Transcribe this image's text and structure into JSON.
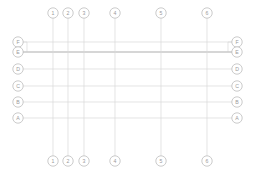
{
  "drawing": {
    "title": "Structural Grid Axis Layout",
    "type": "architectural-grid",
    "background_color": "#ffffff",
    "line_color": "#d8d8d8",
    "emphasis_line_color": "#c9c9c9",
    "bubble_stroke_color": "#b5b5b5",
    "bubble_fill_color": "#ffffff",
    "label_color": "#9a9a9a",
    "bubble_radius": 5.2,
    "canvas": {
      "width": 255,
      "height": 176
    }
  },
  "column_axes": {
    "top_bubble_cy": 13,
    "bottom_bubble_cy": 161,
    "line_top_y": 18,
    "line_bottom_y": 156,
    "items": [
      {
        "label": "1",
        "x": 53
      },
      {
        "label": "2",
        "x": 68
      },
      {
        "label": "3",
        "x": 84
      },
      {
        "label": "4",
        "x": 115
      },
      {
        "label": "5",
        "x": 161
      },
      {
        "label": "6",
        "x": 207
      }
    ]
  },
  "row_axes": {
    "left_bubble_cx": 18,
    "right_bubble_cx": 237,
    "line_left_x": 23,
    "line_right_x": 232,
    "items": [
      {
        "label": "F",
        "y": 42,
        "emphasis": false,
        "stub": true
      },
      {
        "label": "E",
        "y": 52,
        "emphasis": true,
        "stub": false
      },
      {
        "label": "D",
        "y": 69,
        "emphasis": false,
        "stub": false
      },
      {
        "label": "C",
        "y": 86,
        "emphasis": false,
        "stub": false
      },
      {
        "label": "B",
        "y": 102,
        "emphasis": false,
        "stub": false
      },
      {
        "label": "A",
        "y": 118,
        "emphasis": false,
        "stub": false
      }
    ]
  }
}
